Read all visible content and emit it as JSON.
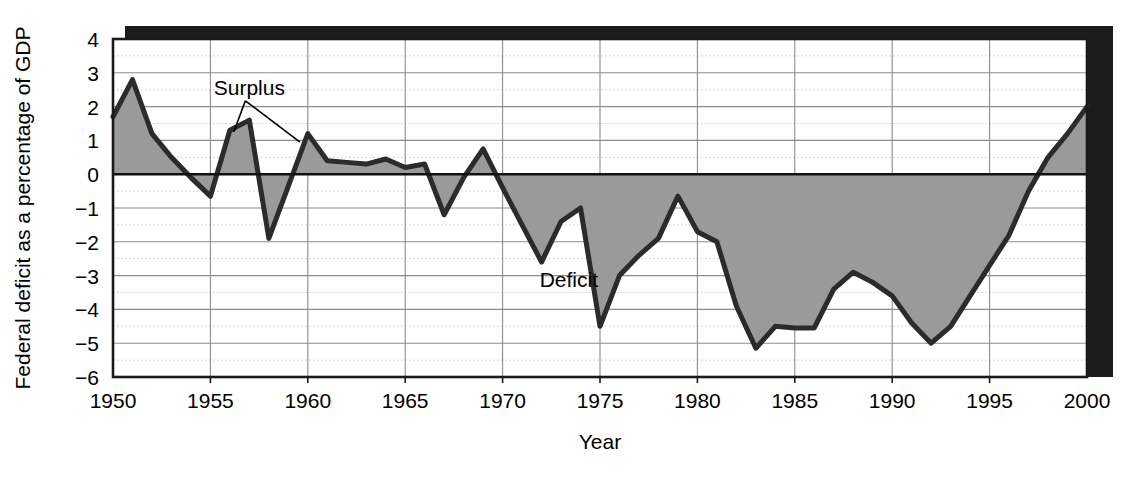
{
  "figure": {
    "title": "",
    "background_color": "#ffffff"
  },
  "style": {
    "series_fill": "#9a9a9a",
    "series_stroke": "#2b2b2b",
    "frame_color": "#1a1a1a",
    "shadow_color": "#1c1c1c",
    "grid_major_color": "#8c8c8c",
    "grid_minor_color": "#c8c8c8",
    "zero_line_color": "#111111",
    "text_color": "#000000"
  },
  "chart_data": {
    "type": "area",
    "title": "",
    "subtitle": "",
    "xlabel": "Year",
    "ylabel": "Federal deficit as a percentage of GDP",
    "xlim": [
      1950,
      2000
    ],
    "ylim": [
      -6,
      4
    ],
    "grid": true,
    "grid_x_major_step": 5,
    "grid_y_major_step": 1,
    "legend": "none",
    "baseline": 0,
    "x_tick_labels": [
      "1950",
      "1955",
      "1960",
      "1965",
      "1970",
      "1975",
      "1980",
      "1985",
      "1990",
      "1995",
      "2000"
    ],
    "x_ticks": [
      1950,
      1955,
      1960,
      1965,
      1970,
      1975,
      1980,
      1985,
      1990,
      1995,
      2000
    ],
    "y_tick_labels": [
      "4",
      "3",
      "2",
      "1",
      "0",
      "−1",
      "−2",
      "−3",
      "−4",
      "−5",
      "−6"
    ],
    "y_ticks": [
      4,
      3,
      2,
      1,
      0,
      -1,
      -2,
      -3,
      -4,
      -5,
      -6
    ],
    "series": [
      {
        "name": "Federal surplus/deficit as a percentage of GDP",
        "fill_positive_label": "Surplus",
        "fill_negative_label": "Deficit",
        "x": [
          1950,
          1951,
          1952,
          1953,
          1954,
          1955,
          1956,
          1957,
          1958,
          1959,
          1960,
          1961,
          1962,
          1963,
          1964,
          1965,
          1966,
          1967,
          1968,
          1969,
          1970,
          1971,
          1972,
          1973,
          1974,
          1975,
          1976,
          1977,
          1978,
          1979,
          1980,
          1981,
          1982,
          1983,
          1984,
          1985,
          1986,
          1987,
          1988,
          1989,
          1990,
          1991,
          1992,
          1993,
          1994,
          1995,
          1996,
          1997,
          1998,
          1999,
          2000
        ],
        "values": [
          1.7,
          2.8,
          1.2,
          0.5,
          -0.1,
          -0.65,
          1.3,
          1.6,
          -1.9,
          -0.35,
          1.2,
          0.4,
          0.35,
          0.3,
          0.45,
          0.2,
          0.3,
          -1.2,
          -0.1,
          0.75,
          -0.4,
          -1.5,
          -2.6,
          -1.4,
          -1.0,
          -4.5,
          -3.0,
          -2.4,
          -1.9,
          -0.65,
          -1.7,
          -2.0,
          -3.9,
          -5.15,
          -4.5,
          -4.55,
          -4.55,
          -3.4,
          -2.9,
          -3.2,
          -3.6,
          -4.4,
          -5.0,
          -4.5,
          -3.6,
          -2.7,
          -1.8,
          -0.5,
          0.5,
          1.2,
          2.0
        ]
      }
    ],
    "annotations": [
      {
        "text": "Surplus",
        "x_data": 1957.0,
        "y_data": 2.35,
        "leader_targets": [
          [
            1956.2,
            1.25
          ],
          [
            1959.6,
            0.95
          ]
        ]
      },
      {
        "text": "Deficit",
        "x_data": 1973.4,
        "y_data": -3.35,
        "leader_targets": []
      }
    ]
  }
}
